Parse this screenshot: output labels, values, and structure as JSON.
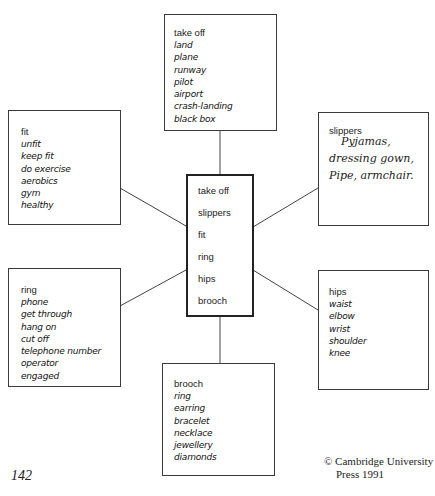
{
  "diagram": {
    "type": "word-map",
    "center": {
      "items": [
        "take off",
        "slippers",
        "fit",
        "ring",
        "hips",
        "brooch"
      ]
    },
    "boxes": {
      "top": {
        "title": "take off",
        "words": [
          "land",
          "plane",
          "runway",
          "pilot",
          "airport",
          "crash-landing",
          "black box"
        ]
      },
      "left_top": {
        "title": "fit",
        "words": [
          "unfit",
          "keep fit",
          "do exercise",
          "aerobics",
          "gym",
          "healthy"
        ]
      },
      "right_top": {
        "title": "slippers",
        "handwritten": [
          "Pyjamas,",
          "dressing gown,",
          "Pipe, armchair."
        ]
      },
      "left_bottom": {
        "title": "ring",
        "words": [
          "phone",
          "get through",
          "hang on",
          "cut off",
          "telephone number",
          "operator",
          "engaged"
        ]
      },
      "right_bottom": {
        "title": "hips",
        "words": [
          "waist",
          "elbow",
          "wrist",
          "shoulder",
          "knee"
        ]
      },
      "bottom": {
        "title": "brooch",
        "words": [
          "ring",
          "earring",
          "bracelet",
          "necklace",
          "jewellery",
          "diamonds"
        ]
      }
    }
  },
  "footer": {
    "page_number": "142",
    "copyright_line1": "© Cambridge University",
    "copyright_line2": "Press 1991"
  }
}
